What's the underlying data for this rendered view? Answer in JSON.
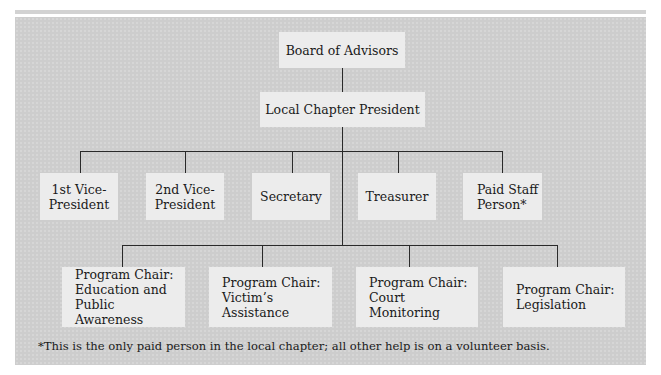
{
  "diagram": {
    "type": "org-chart",
    "top": {
      "label": "Board of Advisors"
    },
    "head": {
      "label": "Local Chapter President"
    },
    "officers": [
      {
        "label": "1st Vice-\nPresident"
      },
      {
        "label": "2nd Vice-\nPresident"
      },
      {
        "label": "Secretary"
      },
      {
        "label": "Treasurer"
      },
      {
        "label": "Paid Staff\nPerson*"
      }
    ],
    "program_chairs": [
      {
        "label": "Program Chair:\nEducation and\nPublic Awareness"
      },
      {
        "label": "Program Chair:\nVictim’s\nAssistance"
      },
      {
        "label": "Program Chair:\nCourt\nMonitoring"
      },
      {
        "label": "Program Chair:\nLegislation"
      }
    ],
    "footnote": "*This is the only paid person in the local chapter; all other help is on a volunteer basis.",
    "colors": {
      "panel": "#cdcdcd",
      "box": "#ececec",
      "line": "#2a2a2a"
    }
  }
}
